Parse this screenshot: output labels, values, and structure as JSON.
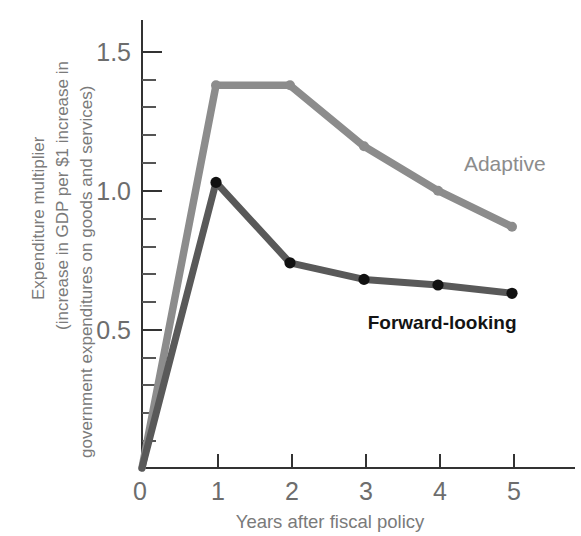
{
  "chart_data": {
    "type": "line",
    "title": "",
    "xlabel": "Years after fiscal policy",
    "ylabel": "Expenditure multiplier (increase in GDP per $1 increase in government expenditures on goods and services)",
    "ylabel_lines": [
      "Expenditure multiplier",
      "(increase in GDP per $1 increase in",
      "government expenditures on goods and services)"
    ],
    "x": [
      0,
      1,
      2,
      3,
      4,
      5
    ],
    "xlim": [
      0,
      5.55
    ],
    "ylim": [
      0,
      1.62
    ],
    "xticks": [
      0,
      1,
      2,
      3,
      4,
      5
    ],
    "xtick_labels": [
      "0",
      "1",
      "2",
      "3",
      "4",
      "5"
    ],
    "yticks": [
      0.5,
      1.0,
      1.5
    ],
    "ytick_labels": [
      "0.5",
      "1.0",
      "1.5"
    ],
    "yticks_minor": [
      0.1,
      0.2,
      0.3,
      0.4,
      0.6,
      0.7,
      0.8,
      0.9,
      1.1,
      1.2,
      1.3,
      1.4
    ],
    "grid": false,
    "legend_position": "inline-annotation",
    "series": [
      {
        "name": "Adaptive",
        "color": "#8c8c8c",
        "marker_color": "#8c8c8c",
        "values": [
          0.0,
          1.38,
          1.38,
          1.16,
          1.0,
          0.87
        ],
        "label_x": 4.35,
        "label_y": 1.07
      },
      {
        "name": "Forward-looking",
        "color": "#595959",
        "marker_color": "#111111",
        "values": [
          0.0,
          1.03,
          0.74,
          0.68,
          0.66,
          0.63
        ],
        "label_x": 3.05,
        "label_y": 0.5
      }
    ]
  },
  "axis": {
    "origin_label": "0",
    "x_title": "Years after fiscal policy"
  },
  "colors": {
    "adaptive": "#8c8c8c",
    "forward_looking": "#595959",
    "axis": "#333333",
    "tick_text": "#6d6d6d",
    "axis_title": "#7a7a7a",
    "background": "#ffffff"
  }
}
